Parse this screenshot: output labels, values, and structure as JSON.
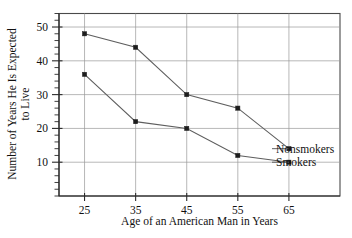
{
  "chart_data": {
    "type": "line",
    "title": "",
    "subtitle": "",
    "xlabel": "Age of an American Man in Years",
    "ylabel": "Number of Years He Is Expected to Live",
    "ylabel_line1": "Number of Years He Is Expected",
    "ylabel_line2": "to Live",
    "x": [
      25,
      35,
      45,
      55,
      65
    ],
    "categories": [
      "25",
      "35",
      "45",
      "55",
      "65"
    ],
    "xtick_labels": [
      "25",
      "35",
      "45",
      "55",
      "65"
    ],
    "ytick_labels": [
      "10",
      "20",
      "30",
      "40",
      "50"
    ],
    "ytick_values": [
      10,
      20,
      30,
      40,
      50
    ],
    "yminor_step": 2,
    "xlim": [
      20,
      75
    ],
    "ylim": [
      0,
      54
    ],
    "grid": true,
    "legend_position": "right-inline",
    "series": [
      {
        "name": "Nonsmokers",
        "values": [
          48,
          44,
          30,
          26,
          14
        ],
        "color": "#5e5e5e",
        "marker_color": "#1d1d1d"
      },
      {
        "name": "Smokers",
        "values": [
          36,
          22,
          20,
          12,
          10
        ],
        "color": "#5e5e5e",
        "marker_color": "#1d1d1d"
      }
    ]
  },
  "legend": {
    "entries": [
      {
        "label": "Nonsmokers"
      },
      {
        "label": "Smokers"
      }
    ]
  },
  "colors": {
    "background": "#ffffff",
    "axis": "#2b2b2b",
    "frame": "#4a4a4a",
    "grid": "#9a9a9a",
    "line": "#5e5e5e",
    "marker": "#1d1d1d",
    "text": "#111111"
  }
}
